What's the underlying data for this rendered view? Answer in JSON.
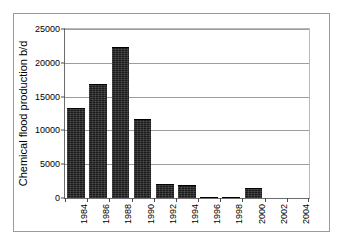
{
  "chart_data": {
    "type": "bar",
    "title": "",
    "xlabel": "",
    "ylabel": "Chemical flood production b/d",
    "ylim": [
      0,
      25000
    ],
    "yticks": [
      0,
      5000,
      10000,
      15000,
      20000,
      25000
    ],
    "ytick_labels": [
      "0",
      "5000",
      "10000",
      "15000",
      "20000",
      "25000"
    ],
    "grid": true,
    "legend": null,
    "xtick_labels": [
      "1984",
      "1986",
      "1988",
      "1990",
      "1992",
      "1994",
      "1996",
      "1998",
      "2000",
      "2002",
      "2004"
    ],
    "categories": [
      "1984",
      "1986",
      "1988",
      "1990",
      "1992",
      "1994",
      "1996",
      "1998",
      "2000",
      "2002",
      "2004"
    ],
    "values": [
      13300,
      16900,
      22400,
      11700,
      2100,
      1900,
      100,
      100,
      1500,
      0,
      0
    ],
    "bar_color": "#1a1a1a"
  },
  "figure": {
    "border_color": "#9a9a9a",
    "axis_color": "#6d6d6d",
    "gridline_color": "#9d9d9d",
    "background": "#ffffff"
  }
}
